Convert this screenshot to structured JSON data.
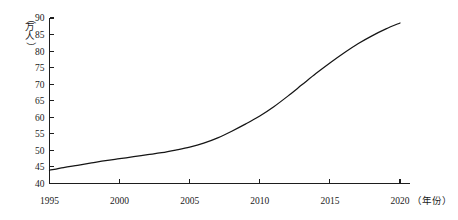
{
  "chart_data": {
    "type": "line",
    "title": "",
    "subtitle": "",
    "xlabel": "（年份）",
    "ylabel": "（万人）",
    "xlim": [
      1995,
      2020
    ],
    "ylim": [
      40,
      90
    ],
    "grid": false,
    "legend": false,
    "legend_position": "none",
    "line_color": "#151515",
    "x": [
      1995,
      1996,
      1997,
      1998,
      1999,
      2000,
      2001,
      2002,
      2003,
      2004,
      2005,
      2006,
      2007,
      2008,
      2009,
      2010,
      2011,
      2012,
      2013,
      2014,
      2015,
      2016,
      2017,
      2018,
      2019,
      2020
    ],
    "values": [
      44.0,
      44.8,
      45.5,
      46.2,
      46.9,
      47.5,
      48.1,
      48.7,
      49.3,
      50.1,
      51.0,
      52.2,
      53.8,
      55.8,
      58.0,
      60.4,
      63.2,
      66.4,
      69.8,
      73.2,
      76.4,
      79.4,
      82.2,
      84.6,
      86.7,
      88.5
    ],
    "series": [
      {
        "name": "人口",
        "values": [
          44.0,
          44.8,
          45.5,
          46.2,
          46.9,
          47.5,
          48.1,
          48.7,
          49.3,
          50.1,
          51.0,
          52.2,
          53.8,
          55.8,
          58.0,
          60.4,
          63.2,
          66.4,
          69.8,
          73.2,
          76.4,
          79.4,
          82.2,
          84.6,
          86.7,
          88.5
        ]
      }
    ],
    "x_ticks": [
      "1995",
      "2000",
      "2005",
      "2010",
      "2015",
      "2020"
    ],
    "x_tick_values": [
      1995,
      2000,
      2005,
      2010,
      2015,
      2020
    ],
    "y_ticks": [
      "40",
      "45",
      "50",
      "55",
      "60",
      "65",
      "70",
      "75",
      "80",
      "85",
      "90"
    ],
    "y_tick_values": [
      40,
      45,
      50,
      55,
      60,
      65,
      70,
      75,
      80,
      85,
      90
    ],
    "y_caption_chars": [
      "（",
      "万",
      "人",
      "）"
    ],
    "annotations": []
  }
}
